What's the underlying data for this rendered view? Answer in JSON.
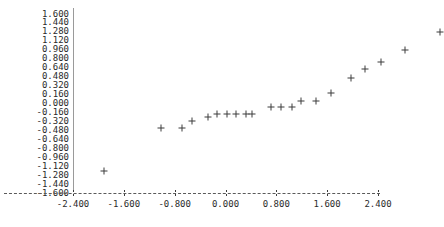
{
  "chart_data": {
    "type": "scatter",
    "title": "",
    "xlabel": "",
    "ylabel": "",
    "xlim": [
      -2.4,
      2.4
    ],
    "ylim": [
      -1.6,
      1.6
    ],
    "grid": false,
    "legend": null,
    "marker": "plus",
    "marker_color": "#3c3c3c",
    "x_ticks": [
      -2.4,
      -1.6,
      -0.8,
      0.0,
      0.8,
      1.6,
      2.4
    ],
    "x_tick_labels": [
      "-2.400",
      "-1.600",
      "-0.800",
      "0.000",
      "0.800",
      "1.600",
      "2.400"
    ],
    "y_ticks": [
      1.6,
      1.44,
      1.28,
      1.12,
      0.96,
      0.8,
      0.64,
      0.48,
      0.32,
      0.16,
      0.0,
      -0.16,
      -0.32,
      -0.48,
      -0.64,
      -0.8,
      -0.96,
      -1.12,
      -1.28,
      -1.44,
      -1.6
    ],
    "y_tick_labels": [
      "1.600",
      "1.440",
      "1.280",
      "1.120",
      "0.960",
      "0.800",
      "0.640",
      "0.480",
      "0.320",
      "0.160",
      "0.000",
      "-0.160",
      "-0.320",
      "-0.480",
      "-0.640",
      "-0.800",
      "-0.960",
      "-1.120",
      "-1.280",
      "-1.440",
      "-1.600"
    ],
    "points": [
      {
        "x": -1.91,
        "y": -1.21
      },
      {
        "x": -1.01,
        "y": -0.43
      },
      {
        "x": -0.68,
        "y": -0.43
      },
      {
        "x": -0.52,
        "y": -0.32
      },
      {
        "x": -0.28,
        "y": -0.25
      },
      {
        "x": -0.13,
        "y": -0.18
      },
      {
        "x": 0.02,
        "y": -0.18
      },
      {
        "x": 0.17,
        "y": -0.18
      },
      {
        "x": 0.33,
        "y": -0.18
      },
      {
        "x": 0.41,
        "y": -0.18
      },
      {
        "x": 0.72,
        "y": -0.07
      },
      {
        "x": 0.88,
        "y": -0.07
      },
      {
        "x": 1.04,
        "y": -0.07
      },
      {
        "x": 1.19,
        "y": 0.04
      },
      {
        "x": 1.42,
        "y": 0.04
      },
      {
        "x": 1.66,
        "y": 0.18
      },
      {
        "x": 1.97,
        "y": 0.46
      },
      {
        "x": 2.2,
        "y": 0.61
      },
      {
        "x": 2.44,
        "y": 0.75
      },
      {
        "x": 2.83,
        "y": 0.96
      },
      {
        "x": 3.38,
        "y": 1.28
      }
    ]
  },
  "axes": {
    "x_tick_glyph": ":",
    "axis_dash_glyph": "-"
  }
}
